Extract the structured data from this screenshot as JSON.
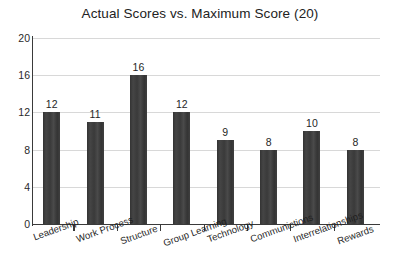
{
  "chart_data": {
    "type": "bar",
    "title": "Actual Scores vs. Maximum Score (20)",
    "xlabel": "",
    "ylabel": "",
    "ylim": [
      0,
      20
    ],
    "yticks": [
      0,
      4,
      8,
      12,
      16,
      20
    ],
    "grid": true,
    "legend": false,
    "bar_color": "#3b3b3b",
    "gridline_color": "#d8d8d8",
    "axis_color": "#3a3a3a",
    "background_color": "#ffffff",
    "data_labels": true,
    "categories": [
      "Leadership",
      "Work Process",
      "Structure",
      "Group Learning",
      "Technology",
      "Communictions",
      "Interrelationships",
      "Rewards"
    ],
    "values": [
      12,
      11,
      16,
      12,
      9,
      8,
      10,
      8
    ],
    "series": [
      {
        "name": "Actual Scores",
        "values": [
          12,
          11,
          16,
          12,
          9,
          8,
          10,
          8
        ]
      }
    ]
  }
}
